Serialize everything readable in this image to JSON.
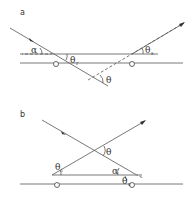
{
  "panels": [
    {
      "id": "a",
      "label": "a",
      "angles": {
        "alpha": "α",
        "theta_r": "θ",
        "theta_r_sub": "r",
        "theta_s": "θ",
        "theta_s_sub": "s",
        "theta": "θ"
      }
    },
    {
      "id": "b",
      "label": "b",
      "angles": {
        "alpha": "α",
        "theta_i": "θ",
        "theta_i_sub": "i",
        "theta_s": "θ",
        "theta_s_sub": "s",
        "theta": "θ"
      }
    }
  ]
}
